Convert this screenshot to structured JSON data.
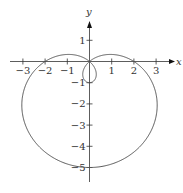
{
  "chart_data": {
    "type": "line",
    "title": "",
    "curve": "polar limacon r = 2 - 3 sin(theta)",
    "xlabel": "x",
    "ylabel": "y",
    "xlim": [
      -3.5,
      3.6
    ],
    "ylim": [
      -5.5,
      2.8
    ],
    "x_ticks": [
      -3,
      -2,
      -1,
      1,
      2,
      3
    ],
    "y_ticks": [
      1,
      -1,
      -2,
      -3,
      -4,
      -5
    ],
    "x_tick_labels": [
      "−3",
      "−2",
      "−1",
      "1",
      "2",
      "3"
    ],
    "y_tick_labels": [
      "1",
      "−1",
      "−2",
      "−3",
      "−4",
      "−5"
    ],
    "key_points": {
      "outer_bottom": [
        0,
        -5
      ],
      "inner_loop_bottom": [
        0,
        -1
      ],
      "x_intercepts": [
        [
          -2,
          0
        ],
        [
          2,
          0
        ]
      ],
      "pole": [
        0,
        0
      ]
    },
    "grid": false,
    "legend": null
  },
  "labels": {
    "x_axis": "x",
    "y_axis": "y"
  },
  "style": {
    "curve_color": "#555555",
    "axis_color": "#333333"
  }
}
